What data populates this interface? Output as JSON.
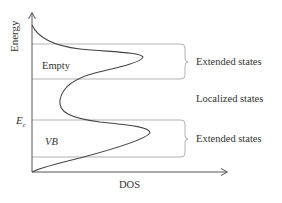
{
  "diagram": {
    "title": "",
    "axes": {
      "y_label": "Energy",
      "x_label": "DOS"
    },
    "regions": [
      {
        "label": "Empty",
        "type": "band"
      },
      {
        "label": "VB",
        "type": "band"
      }
    ],
    "energy_marker": {
      "symbol": "E",
      "subscript": "c"
    },
    "state_labels": [
      {
        "label": "Extended states"
      },
      {
        "label": "Localized states"
      },
      {
        "label": "Extended states"
      }
    ],
    "colors": {
      "curve": "#444444",
      "guide_lines": "#aaaaaa",
      "axes": "#555555",
      "text": "#333333"
    }
  }
}
